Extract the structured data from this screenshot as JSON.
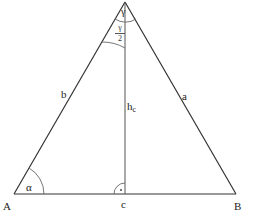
{
  "diagram": {
    "type": "triangle",
    "stroke_color": "#333333",
    "arc_color": "#555555",
    "vertices": {
      "A": {
        "label": "A",
        "x": 14,
        "y": 194
      },
      "B": {
        "label": "B",
        "x": 236,
        "y": 194
      },
      "C": {
        "label": "",
        "x": 125,
        "y": 2
      }
    },
    "sides": {
      "a": {
        "label": "a"
      },
      "b": {
        "label": "b"
      },
      "c": {
        "label": "c"
      }
    },
    "altitude": {
      "label": "h",
      "subscript": "c"
    },
    "angles": {
      "alpha": {
        "label": "α"
      },
      "gamma": {
        "label": "γ"
      },
      "half_gamma": {
        "numerator": "γ",
        "denominator": "2"
      },
      "right_angle_marker": "·"
    }
  }
}
